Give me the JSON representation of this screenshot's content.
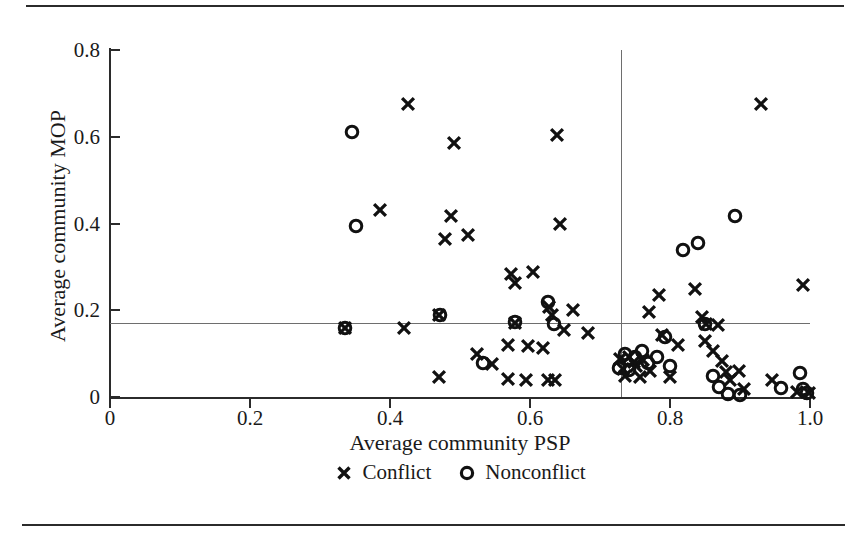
{
  "figure": {
    "type": "scatter",
    "background": "#ffffff",
    "ink_color": "#1a1a1a",
    "reference_line_color": "#6e6e6e"
  },
  "chart_data": {
    "type": "scatter",
    "title": "",
    "xlabel": "Average community PSP",
    "ylabel": "Average community MOP",
    "xlim": [
      0,
      1.0
    ],
    "ylim": [
      0,
      0.8
    ],
    "xticks": [
      0,
      0.2,
      0.4,
      0.6,
      0.8,
      1.0
    ],
    "xticklabels": [
      "0",
      "0.2",
      "0.4",
      "0.6",
      "0.8",
      "1.0"
    ],
    "yticks": [
      0,
      0.2,
      0.4,
      0.6,
      0.8
    ],
    "yticklabels": [
      "0",
      "0.2",
      "0.4",
      "0.6",
      "0.8"
    ],
    "grid": false,
    "reference_lines": {
      "horizontal": 0.17,
      "vertical": 0.73
    },
    "legend": {
      "position": "below-axis",
      "entries": [
        {
          "label": "Conflict",
          "marker": "x"
        },
        {
          "label": "Nonconflict",
          "marker": "o"
        }
      ]
    },
    "series": [
      {
        "name": "Conflict",
        "marker": "x",
        "points": [
          [
            0.336,
            0.16
          ],
          [
            0.425,
            0.675
          ],
          [
            0.385,
            0.43
          ],
          [
            0.42,
            0.158
          ],
          [
            0.47,
            0.19
          ],
          [
            0.492,
            0.585
          ],
          [
            0.487,
            0.418
          ],
          [
            0.478,
            0.365
          ],
          [
            0.512,
            0.373
          ],
          [
            0.47,
            0.046
          ],
          [
            0.524,
            0.1
          ],
          [
            0.545,
            0.075
          ],
          [
            0.573,
            0.283
          ],
          [
            0.578,
            0.262
          ],
          [
            0.604,
            0.288
          ],
          [
            0.578,
            0.17
          ],
          [
            0.569,
            0.12
          ],
          [
            0.597,
            0.118
          ],
          [
            0.568,
            0.042
          ],
          [
            0.594,
            0.04
          ],
          [
            0.625,
            0.04
          ],
          [
            0.636,
            0.04
          ],
          [
            0.627,
            0.208
          ],
          [
            0.631,
            0.19
          ],
          [
            0.618,
            0.112
          ],
          [
            0.638,
            0.605
          ],
          [
            0.643,
            0.398
          ],
          [
            0.662,
            0.2
          ],
          [
            0.648,
            0.155
          ],
          [
            0.683,
            0.148
          ],
          [
            0.742,
            0.092
          ],
          [
            0.728,
            0.088
          ],
          [
            0.733,
            0.065
          ],
          [
            0.735,
            0.048
          ],
          [
            0.748,
            0.08
          ],
          [
            0.752,
            0.072
          ],
          [
            0.757,
            0.046
          ],
          [
            0.762,
            0.085
          ],
          [
            0.77,
            0.196
          ],
          [
            0.772,
            0.06
          ],
          [
            0.784,
            0.236
          ],
          [
            0.788,
            0.142
          ],
          [
            0.8,
            0.046
          ],
          [
            0.812,
            0.12
          ],
          [
            0.836,
            0.248
          ],
          [
            0.845,
            0.185
          ],
          [
            0.852,
            0.168
          ],
          [
            0.85,
            0.13
          ],
          [
            0.862,
            0.105
          ],
          [
            0.869,
            0.165
          ],
          [
            0.874,
            0.082
          ],
          [
            0.88,
            0.057
          ],
          [
            0.885,
            0.04
          ],
          [
            0.898,
            0.06
          ],
          [
            0.906,
            0.018
          ],
          [
            0.93,
            0.675
          ],
          [
            0.945,
            0.04
          ],
          [
            0.99,
            0.258
          ],
          [
            0.982,
            0.012
          ],
          [
            0.998,
            0.01
          ]
        ]
      },
      {
        "name": "Nonconflict",
        "marker": "o",
        "points": [
          [
            0.336,
            0.16
          ],
          [
            0.345,
            0.61
          ],
          [
            0.352,
            0.395
          ],
          [
            0.472,
            0.19
          ],
          [
            0.533,
            0.078
          ],
          [
            0.578,
            0.172
          ],
          [
            0.626,
            0.218
          ],
          [
            0.634,
            0.168
          ],
          [
            0.727,
            0.068
          ],
          [
            0.735,
            0.1
          ],
          [
            0.741,
            0.062
          ],
          [
            0.75,
            0.092
          ],
          [
            0.76,
            0.105
          ],
          [
            0.768,
            0.078
          ],
          [
            0.782,
            0.092
          ],
          [
            0.793,
            0.138
          ],
          [
            0.8,
            0.072
          ],
          [
            0.818,
            0.338
          ],
          [
            0.84,
            0.355
          ],
          [
            0.85,
            0.168
          ],
          [
            0.862,
            0.048
          ],
          [
            0.87,
            0.022
          ],
          [
            0.883,
            0.008
          ],
          [
            0.893,
            0.418
          ],
          [
            0.9,
            0.004
          ],
          [
            0.958,
            0.02
          ],
          [
            0.985,
            0.055
          ],
          [
            0.99,
            0.018
          ],
          [
            0.996,
            0.01
          ]
        ]
      }
    ]
  }
}
